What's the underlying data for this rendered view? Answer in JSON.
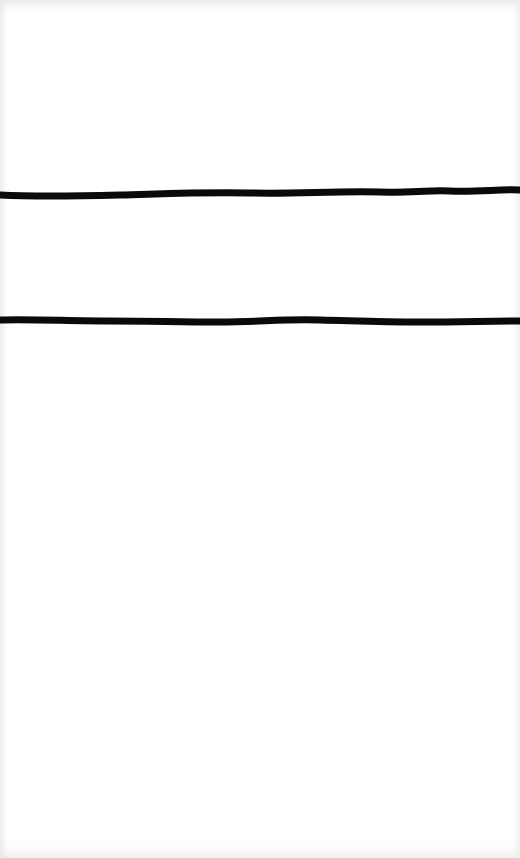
{
  "sheet": {
    "background": "#ffffff",
    "strokes": [
      {
        "name": "upper-line",
        "top": 180,
        "color": "#0a0a0a"
      },
      {
        "name": "lower-line",
        "top": 308,
        "color": "#0a0a0a"
      }
    ]
  }
}
